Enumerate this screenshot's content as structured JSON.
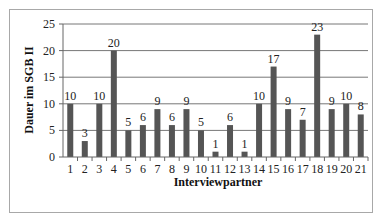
{
  "chart_data": {
    "type": "bar",
    "title": "",
    "xlabel": "Interviewpartner",
    "ylabel": "Dauer im SGB II",
    "categories": [
      "1",
      "2",
      "3",
      "4",
      "5",
      "6",
      "7",
      "8",
      "9",
      "10",
      "11",
      "12",
      "13",
      "14",
      "15",
      "16",
      "17",
      "18",
      "19",
      "20",
      "21"
    ],
    "values": [
      10,
      3,
      10,
      20,
      5,
      6,
      9,
      6,
      9,
      5,
      1,
      6,
      1,
      10,
      17,
      9,
      7,
      23,
      9,
      10,
      8
    ],
    "ylim": [
      0,
      25
    ],
    "yticks": [
      0,
      5,
      10,
      15,
      20,
      25
    ],
    "grid": true,
    "legend": null,
    "data_labels": true,
    "bar_color": "#555555"
  }
}
